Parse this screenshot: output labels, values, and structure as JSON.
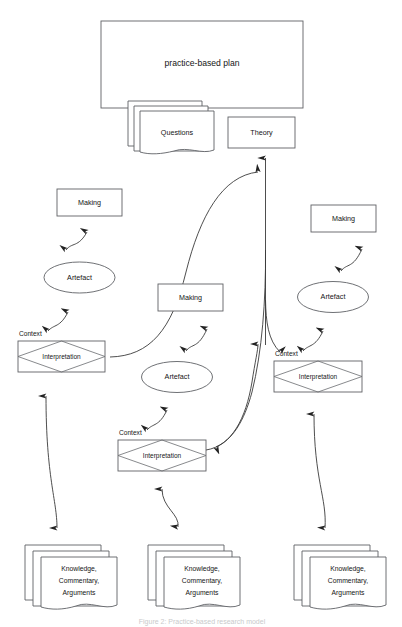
{
  "diagram": {
    "title": "practice-based plan",
    "caption": "Figure 2: Practice-based research model",
    "colors": {
      "stroke": "#5f6165",
      "connector": "#3a3a3a",
      "text": "#151515",
      "background": "#ffffff"
    },
    "top": {
      "plan_label": "practice-based plan",
      "questions_label": "Questions",
      "theory_label": "Theory"
    },
    "branches": [
      {
        "id": "left",
        "making_label": "Making",
        "artefact_label": "Artefact",
        "context_label": "Context",
        "interpretation_label": "Interpretation",
        "output_lines": [
          "Knowledge,",
          "Commentary,",
          "Arguments"
        ]
      },
      {
        "id": "middle",
        "making_label": "Making",
        "artefact_label": "Artefact",
        "context_label": "Context",
        "interpretation_label": "Interpretation",
        "output_lines": [
          "Knowledge,",
          "Commentary,",
          "Arguments"
        ]
      },
      {
        "id": "right",
        "making_label": "Making",
        "artefact_label": "Artefact",
        "context_label": "Context",
        "interpretation_label": "Interpretation",
        "output_lines": [
          "Knowledge,",
          "Commentary,",
          "Arguments"
        ]
      }
    ]
  }
}
